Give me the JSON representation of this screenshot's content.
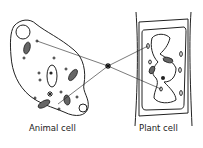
{
  "diagram": {
    "labels": {
      "animal": "Animal cell",
      "plant": "Plant cell"
    },
    "center_marker": "asterisk",
    "colors": {
      "line": "#222222",
      "background": "#ffffff"
    }
  }
}
